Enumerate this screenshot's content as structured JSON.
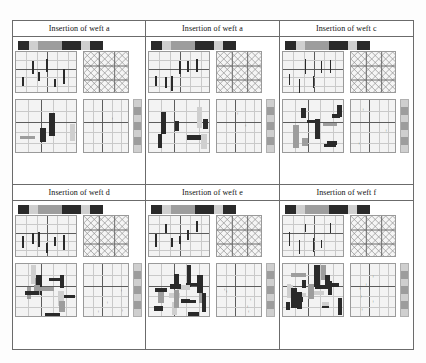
{
  "figure": {
    "rows": 2,
    "columns": 3
  },
  "palette": {
    "dark": "#2a2a2a",
    "mid": "#9d9d9d",
    "light": "#cfcfcf",
    "paper": "#f3f3f3",
    "grid_minor": "#c9c9c9",
    "grid_major": "#5c5c5c",
    "border": "#6b6b6b"
  },
  "cells": [
    {
      "id": "cell-weft-a-1",
      "title": "Insertion of weft a",
      "colorbar": [
        "dark",
        "light",
        "mid",
        "dark",
        "dark",
        "light",
        "dark"
      ],
      "warp_ticks": 6,
      "lattice_rows": 3,
      "lattice_cols": 3,
      "weft_blocks": 4,
      "dots": 1,
      "strip_segments": [
        "light",
        "mid",
        "light",
        "mid",
        "light",
        "mid",
        "light"
      ]
    },
    {
      "id": "cell-weft-a-2",
      "title": "Insertion of weft a",
      "colorbar": [
        "dark",
        "light",
        "mid",
        "dark",
        "dark",
        "light",
        "dark"
      ],
      "warp_ticks": 6,
      "lattice_rows": 3,
      "lattice_cols": 3,
      "weft_blocks": 7,
      "dots": 2,
      "strip_segments": [
        "light",
        "mid",
        "light",
        "mid",
        "light",
        "mid",
        "light"
      ]
    },
    {
      "id": "cell-weft-c",
      "title": "Insertion of weft c",
      "colorbar": [
        "dark",
        "light",
        "mid",
        "dark",
        "dark",
        "light",
        "dark"
      ],
      "warp_ticks": 6,
      "lattice_rows": 3,
      "lattice_cols": 3,
      "weft_blocks": 10,
      "dots": 3,
      "strip_segments": [
        "light",
        "mid",
        "light",
        "mid",
        "light",
        "mid",
        "light"
      ]
    },
    {
      "id": "cell-weft-d",
      "title": "Insertion of weft d",
      "colorbar": [
        "dark",
        "light",
        "mid",
        "dark",
        "dark",
        "light",
        "dark"
      ],
      "warp_ticks": 6,
      "lattice_rows": 3,
      "lattice_cols": 3,
      "weft_blocks": 14,
      "dots": 4,
      "strip_segments": [
        "light",
        "mid",
        "light",
        "mid",
        "light",
        "mid",
        "light"
      ]
    },
    {
      "id": "cell-weft-e",
      "title": "Insertion of weft e",
      "colorbar": [
        "dark",
        "light",
        "mid",
        "dark",
        "dark",
        "light",
        "dark"
      ],
      "warp_ticks": 6,
      "lattice_rows": 3,
      "lattice_cols": 3,
      "weft_blocks": 17,
      "dots": 5,
      "strip_segments": [
        "light",
        "mid",
        "light",
        "mid",
        "light",
        "mid",
        "light"
      ]
    },
    {
      "id": "cell-weft-f",
      "title": "Insertion of weft f",
      "colorbar": [
        "dark",
        "light",
        "mid",
        "dark",
        "dark",
        "light",
        "dark"
      ],
      "warp_ticks": 6,
      "lattice_rows": 3,
      "lattice_cols": 3,
      "weft_blocks": 20,
      "dots": 6,
      "strip_segments": [
        "light",
        "mid",
        "light",
        "mid",
        "light",
        "mid",
        "light"
      ]
    }
  ]
}
